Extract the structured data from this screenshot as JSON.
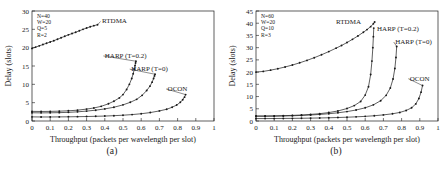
{
  "figure": {
    "panels": [
      {
        "caption": "(a)",
        "params": [
          "N=40",
          "W=20",
          "Q=5",
          "R=2"
        ],
        "chart_index": 0
      },
      {
        "caption": "(b)",
        "params": [
          "N=60",
          "W=20",
          "Q=10",
          "R=3"
        ],
        "chart_index": 1
      }
    ]
  },
  "chart_data": [
    {
      "type": "line",
      "title": "",
      "subcaption": "(a)",
      "xlabel": "Throughput (packets per wavelength per slot)",
      "ylabel": "Delay (slots)",
      "xlim": [
        0,
        1
      ],
      "ylim": [
        0,
        30
      ],
      "xticks": [
        "0",
        "0.1",
        "0.2",
        "0.3",
        "0.4",
        "0.5",
        "0.6",
        "0.7",
        "0.8",
        "0.9",
        "1"
      ],
      "yticks": [
        "0",
        "5",
        "10",
        "15",
        "20",
        "25",
        "30"
      ],
      "grid": false,
      "legend_position": "inline-annotations",
      "annotations": [
        "N=40",
        "W=20",
        "Q=5",
        "R=2"
      ],
      "series": [
        {
          "name": "RTDMA",
          "label_x": 0.385,
          "label_y": 26.6,
          "x": [
            0.0,
            0.02,
            0.04,
            0.06,
            0.08,
            0.1,
            0.12,
            0.14,
            0.16,
            0.18,
            0.2,
            0.22,
            0.24,
            0.26,
            0.28,
            0.3,
            0.32,
            0.34,
            0.36
          ],
          "y": [
            19.8,
            20.15,
            20.5,
            20.85,
            21.2,
            21.55,
            21.9,
            22.3,
            22.7,
            23.1,
            23.5,
            23.85,
            24.2,
            24.6,
            25.0,
            25.35,
            25.7,
            26.0,
            26.25
          ]
        },
        {
          "name": "HARP (T=0.2)",
          "label_x": 0.4,
          "label_y": 17.2,
          "x": [
            0.0,
            0.05,
            0.1,
            0.15,
            0.2,
            0.25,
            0.3,
            0.34,
            0.38,
            0.42,
            0.45,
            0.48,
            0.5,
            0.52,
            0.535,
            0.548,
            0.556,
            0.562,
            0.566,
            0.569,
            0.571
          ],
          "y": [
            2.62,
            2.6,
            2.62,
            2.68,
            2.78,
            2.95,
            3.25,
            3.55,
            4.0,
            4.7,
            5.4,
            6.3,
            7.2,
            8.6,
            10.0,
            11.6,
            12.9,
            14.1,
            15.1,
            15.8,
            16.3
          ]
        },
        {
          "name": "HARP (T=0)",
          "label_x": 0.545,
          "label_y": 13.6,
          "x": [
            0.0,
            0.05,
            0.1,
            0.15,
            0.2,
            0.25,
            0.3,
            0.35,
            0.4,
            0.45,
            0.5,
            0.54,
            0.575,
            0.605,
            0.63,
            0.648,
            0.66,
            0.668,
            0.673,
            0.676
          ],
          "y": [
            2.25,
            2.22,
            2.24,
            2.28,
            2.36,
            2.5,
            2.7,
            2.95,
            3.3,
            3.75,
            4.4,
            5.1,
            5.9,
            7.0,
            8.3,
            9.5,
            10.6,
            11.6,
            12.3,
            12.75
          ]
        },
        {
          "name": "OCON",
          "label_x": 0.745,
          "label_y": 8.2,
          "x": [
            0.0,
            0.05,
            0.1,
            0.15,
            0.2,
            0.25,
            0.3,
            0.35,
            0.4,
            0.45,
            0.5,
            0.55,
            0.6,
            0.65,
            0.7,
            0.74,
            0.77,
            0.795,
            0.815,
            0.828,
            0.838,
            0.844
          ],
          "y": [
            1.12,
            1.1,
            1.1,
            1.12,
            1.14,
            1.18,
            1.22,
            1.28,
            1.35,
            1.45,
            1.58,
            1.75,
            1.98,
            2.3,
            2.75,
            3.2,
            3.75,
            4.35,
            5.1,
            5.8,
            6.5,
            7.2
          ]
        }
      ]
    },
    {
      "type": "line",
      "title": "",
      "subcaption": "(b)",
      "xlabel": "Throughput (packets per wavelength per slot)",
      "ylabel": "Delay (slots)",
      "xlim": [
        0,
        1
      ],
      "ylim": [
        0,
        45
      ],
      "xticks": [
        "0",
        "0.1",
        "0.2",
        "0.3",
        "0.4",
        "0.5",
        "0.6",
        "0.7",
        "0.8",
        "0.9",
        "1"
      ],
      "yticks": [
        "0",
        "5",
        "10",
        "15",
        "20",
        "25",
        "30",
        "35",
        "40",
        "45"
      ],
      "grid": false,
      "legend_position": "inline-annotations",
      "annotations": [
        "N=60",
        "W=20",
        "Q=10",
        "R=3"
      ],
      "series": [
        {
          "name": "RTDMA",
          "label_x": 0.44,
          "label_y": 39.5,
          "x": [
            0.0,
            0.04,
            0.08,
            0.12,
            0.16,
            0.2,
            0.24,
            0.28,
            0.32,
            0.36,
            0.4,
            0.44,
            0.47,
            0.5,
            0.53,
            0.56,
            0.59,
            0.61,
            0.63,
            0.645,
            0.652
          ],
          "y": [
            20.0,
            20.3,
            20.8,
            21.4,
            22.1,
            22.9,
            23.8,
            24.8,
            25.9,
            27.1,
            28.4,
            29.8,
            30.9,
            32.1,
            33.4,
            34.8,
            36.3,
            37.4,
            38.6,
            39.8,
            40.5
          ]
        },
        {
          "name": "HARP (T=0.2)",
          "label_x": 0.665,
          "label_y": 37.0,
          "x": [
            0.0,
            0.05,
            0.1,
            0.15,
            0.2,
            0.25,
            0.3,
            0.35,
            0.4,
            0.45,
            0.5,
            0.54,
            0.575,
            0.6,
            0.618,
            0.63,
            0.637,
            0.642,
            0.645,
            0.647
          ],
          "y": [
            2.05,
            2.05,
            2.1,
            2.18,
            2.3,
            2.45,
            2.7,
            3.0,
            3.45,
            4.1,
            5.1,
            6.3,
            8.0,
            10.6,
            14.0,
            19.0,
            24.5,
            30.0,
            34.5,
            38.0
          ]
        },
        {
          "name": "HARP (T=0)",
          "label_x": 0.765,
          "label_y": 31.5,
          "x": [
            0.0,
            0.05,
            0.1,
            0.15,
            0.2,
            0.25,
            0.3,
            0.35,
            0.4,
            0.45,
            0.5,
            0.55,
            0.6,
            0.645,
            0.685,
            0.715,
            0.738,
            0.753,
            0.763,
            0.769,
            0.773
          ],
          "y": [
            1.95,
            1.95,
            1.98,
            2.05,
            2.14,
            2.28,
            2.45,
            2.68,
            2.98,
            3.35,
            3.85,
            4.5,
            5.4,
            6.6,
            8.3,
            10.5,
            13.5,
            17.2,
            21.5,
            26.0,
            30.5
          ]
        },
        {
          "name": "OCON",
          "label_x": 0.845,
          "label_y": 16.5,
          "x": [
            0.0,
            0.05,
            0.1,
            0.15,
            0.2,
            0.25,
            0.3,
            0.35,
            0.4,
            0.45,
            0.5,
            0.55,
            0.6,
            0.65,
            0.7,
            0.75,
            0.79,
            0.825,
            0.855,
            0.878,
            0.895,
            0.907,
            0.915
          ],
          "y": [
            1.0,
            1.0,
            1.02,
            1.05,
            1.08,
            1.12,
            1.18,
            1.24,
            1.32,
            1.42,
            1.55,
            1.7,
            1.9,
            2.15,
            2.5,
            2.95,
            3.5,
            4.3,
            5.4,
            7.0,
            9.2,
            11.8,
            14.5
          ]
        }
      ]
    }
  ]
}
